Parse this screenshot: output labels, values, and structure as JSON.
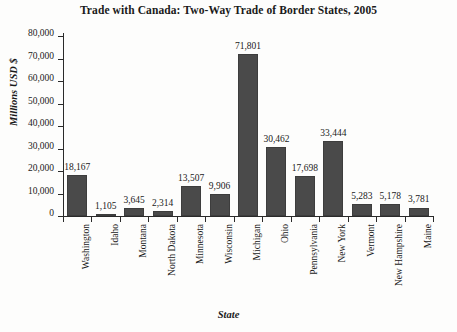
{
  "chart_data": {
    "type": "bar",
    "title": "Trade with Canada: Two-Way Trade of Border States, 2005",
    "xlabel": "State",
    "ylabel": "Millions USD $",
    "categories": [
      "Washington",
      "Idaho",
      "Montana",
      "North Dakota",
      "Minnesota",
      "Wisconsin",
      "Michigan",
      "Ohio",
      "Pennsylvania",
      "New York",
      "Vermont",
      "New Hampshire",
      "Maine"
    ],
    "values": [
      18167,
      1105,
      3645,
      2314,
      13507,
      9906,
      71801,
      30462,
      17698,
      33444,
      5283,
      5178,
      3781
    ],
    "value_labels": [
      "18,167",
      "1,105",
      "3,645",
      "2,314",
      "13,507",
      "9,906",
      "71,801",
      "30,462",
      "17,698",
      "33,444",
      "5,283",
      "5,178",
      "3,781"
    ],
    "ylim": [
      0,
      80000
    ],
    "ytick_values": [
      80000,
      70000,
      60000,
      50000,
      40000,
      30000,
      20000,
      10000,
      0
    ],
    "ytick_labels": [
      "80,000",
      "70,000",
      "60,000",
      "50,000",
      "40,000",
      "30,000",
      "20,000",
      "10,000",
      "0"
    ],
    "grid": false,
    "legend": false,
    "bar_color": "#4a4a4a"
  }
}
